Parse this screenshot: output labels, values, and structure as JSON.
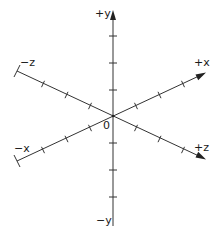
{
  "diagram": {
    "origin_label": "0",
    "axes": [
      {
        "id": "pos-y",
        "label": "+y",
        "arrow": true
      },
      {
        "id": "neg-y",
        "label": "−y",
        "arrow": false
      },
      {
        "id": "pos-x",
        "label": "+x",
        "arrow": true
      },
      {
        "id": "neg-x",
        "label": "−x",
        "arrow": false
      },
      {
        "id": "pos-z",
        "label": "+z",
        "arrow": true
      },
      {
        "id": "neg-z",
        "label": "−z",
        "arrow": false
      }
    ],
    "ticks_per_half_axis": 3,
    "colors": {
      "line": "#333333",
      "text": "#1a1a1a",
      "background": "#ffffff"
    }
  }
}
